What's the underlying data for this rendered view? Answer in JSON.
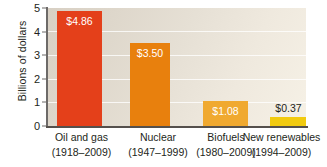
{
  "chart_data": {
    "type": "bar",
    "title": "",
    "xlabel": "",
    "ylabel": "Billions of dollars",
    "ylim": [
      0,
      5
    ],
    "yticks": [
      0,
      1,
      2,
      3,
      4,
      5
    ],
    "ytick_labels": [
      "0",
      "1",
      "2",
      "3",
      "4",
      "5"
    ],
    "grid": true,
    "legend": "none",
    "categories": [
      "Oil and gas",
      "Nuclear",
      "Biofuels",
      "New renewables"
    ],
    "category_periods": [
      "(1918–2009)",
      "(1947–1999)",
      "(1980–2009)",
      "(1994–2009)"
    ],
    "values": [
      4.86,
      3.5,
      1.08,
      0.37
    ],
    "data_labels": [
      "$4.86",
      "$3.50",
      "$1.08",
      "$0.37"
    ],
    "label_placement": [
      "inside",
      "inside",
      "inside",
      "outside"
    ],
    "bar_colors": [
      "#e4401a",
      "#e8800d",
      "#f0a930",
      "#f2cb10"
    ],
    "background_color": "#e4ded2",
    "gridline_color": "#ffffff",
    "axis_color": "#55504c",
    "text_color": "#231f20"
  }
}
